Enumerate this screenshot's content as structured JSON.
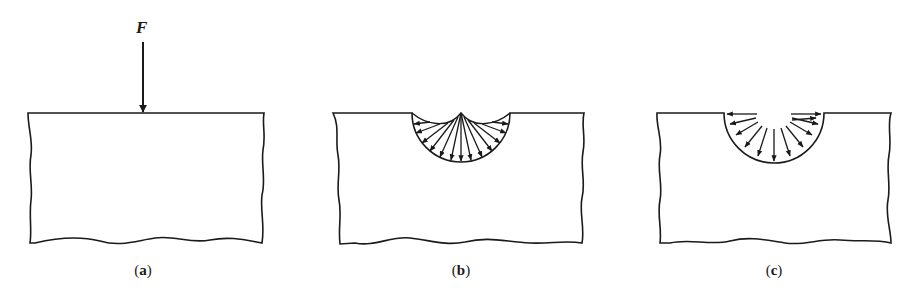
{
  "figure": {
    "panels": [
      {
        "id": "a",
        "caption": "(a)",
        "description": "Rigid block with concentrated point load F applied at top surface"
      },
      {
        "id": "b",
        "caption": "(b)",
        "description": "Circular indentation with stress arrows converging toward the surface center point"
      },
      {
        "id": "c",
        "caption": "(c)",
        "description": "Semicircular indentation with stress arrows radiating outward from center"
      }
    ],
    "force_label": "F",
    "colors": {
      "line": "#1a1a1a",
      "background": "#ffffff"
    }
  }
}
